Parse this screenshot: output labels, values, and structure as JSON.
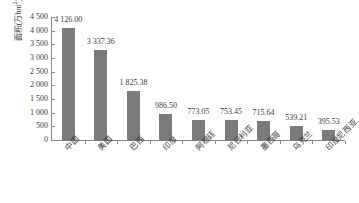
{
  "chart_data": {
    "type": "bar",
    "title": "",
    "subtitle": "",
    "xlabel": "",
    "ylabel": "面积(万hm²)",
    "ylabel_text": "面积(万hm",
    "ylabel_sup": "2",
    "ylabel_tail": ")",
    "ylim": [
      0,
      4500
    ],
    "ytick_step": 500,
    "grid": false,
    "legend": false,
    "legend_position": "none",
    "thousands_separator": " ",
    "categories": [
      "中国",
      "美国",
      "巴西",
      "印度",
      "阿根廷",
      "尼日利亚",
      "墨西哥",
      "乌克兰",
      "印度尼西亚"
    ],
    "values": [
      4126.0,
      3337.36,
      1825.38,
      986.5,
      773.05,
      753.45,
      715.64,
      539.21,
      395.53
    ],
    "value_labels": [
      "4 126.00",
      "3 337.36",
      "1 825.38",
      "986.50",
      "773.05",
      "753.45",
      "715.64",
      "539.21",
      "395.53"
    ],
    "ytick_labels": [
      "4 500",
      "4 000",
      "3 500",
      "3 000",
      "2 500",
      "2 000",
      "1 500",
      "1 000",
      "500",
      "0"
    ],
    "ytick_values": [
      4500,
      4000,
      3500,
      3000,
      2500,
      2000,
      1500,
      1000,
      500,
      0
    ],
    "bar_color": "#7b7b7b",
    "axis_color": "#8a8a8a",
    "text_color": "#3c3c3c",
    "background_color": "#ffffff"
  }
}
